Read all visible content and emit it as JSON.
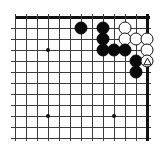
{
  "figure": {
    "name": "go-board-diagram",
    "type": "go-problem-diagram",
    "board_size": 19,
    "visible_columns": 13,
    "visible_rows": 12,
    "colors": {
      "background": "#ffffff",
      "grid_line": "#3c3c3c",
      "border_line": "#111111",
      "black_stone": "#0a0a0a",
      "white_stone": "#ffffff",
      "stone_outline": "#141414",
      "star_point": "#101010"
    },
    "geometry": {
      "origin_x": 15,
      "origin_y": 17,
      "cell": 11,
      "stone_diameter": 13
    }
  },
  "grid": {
    "vertical_lines_x": [
      15,
      26,
      37,
      48,
      59,
      70,
      81,
      92,
      103,
      114,
      125,
      136,
      147
    ],
    "horizontal_lines_y": [
      17,
      28,
      39,
      50,
      61,
      72,
      83,
      94,
      105,
      116,
      127,
      138
    ],
    "top_edge_thick": true,
    "right_edge_thick": true,
    "left_edge_thick": false,
    "bottom_edge_thick": false
  },
  "star_points": [
    {
      "name": "hoshi-upper-left",
      "x": 48,
      "y": 50
    },
    {
      "name": "hoshi-lower-left",
      "x": 48,
      "y": 116
    },
    {
      "name": "hoshi-lower-right",
      "x": 114,
      "y": 116
    }
  ],
  "stones": [
    {
      "id": 1,
      "color": "black",
      "x": 81,
      "y": 28,
      "mark": null
    },
    {
      "id": 2,
      "color": "black",
      "x": 103,
      "y": 28,
      "mark": null
    },
    {
      "id": 3,
      "color": "white",
      "x": 125,
      "y": 28,
      "mark": null
    },
    {
      "id": 4,
      "color": "black",
      "x": 103,
      "y": 39,
      "mark": null
    },
    {
      "id": 5,
      "color": "white",
      "x": 125,
      "y": 39,
      "mark": null
    },
    {
      "id": 6,
      "color": "white",
      "x": 136,
      "y": 39,
      "mark": null
    },
    {
      "id": 7,
      "color": "white",
      "x": 147,
      "y": 39,
      "mark": null
    },
    {
      "id": 8,
      "color": "black",
      "x": 103,
      "y": 50,
      "mark": null
    },
    {
      "id": 9,
      "color": "black",
      "x": 114,
      "y": 50,
      "mark": null
    },
    {
      "id": 10,
      "color": "black",
      "x": 125,
      "y": 50,
      "mark": null
    },
    {
      "id": 11,
      "color": "white",
      "x": 147,
      "y": 50,
      "mark": null
    },
    {
      "id": 12,
      "color": "black",
      "x": 136,
      "y": 61,
      "mark": null
    },
    {
      "id": 13,
      "color": "white",
      "x": 147,
      "y": 61,
      "mark": "triangle"
    },
    {
      "id": 14,
      "color": "black",
      "x": 136,
      "y": 72,
      "mark": null
    }
  ],
  "counts": {
    "black_stones": 8,
    "white_stones": 6,
    "marked_stones": 1
  },
  "caption": {
    "text": ""
  }
}
